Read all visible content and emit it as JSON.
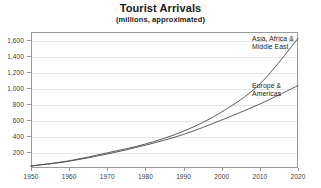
{
  "chart_data": {
    "type": "line",
    "title": "Tourist Arrivals",
    "subtitle": "(millions, approximated)",
    "xlabel": "",
    "ylabel": "",
    "xlim": [
      1950,
      2020
    ],
    "ylim": [
      0,
      1700
    ],
    "grid": true,
    "legend_position": "inline-right",
    "x": [
      1950,
      1960,
      1970,
      1980,
      1990,
      2000,
      2010,
      2020
    ],
    "x_tick_labels": [
      "1950",
      "1960",
      "1970",
      "1980",
      "1990",
      "2000",
      "2010",
      "2020"
    ],
    "y_ticks": [
      200,
      400,
      600,
      800,
      1000,
      1200,
      1400,
      1600
    ],
    "y_tick_labels": [
      "200",
      "400",
      "600",
      "800",
      "1,000",
      "1,200",
      "1,400",
      "1,600"
    ],
    "series": [
      {
        "name": "Asia, Africa & Middle East",
        "label_text": "Asia, Africa &\nMiddle East",
        "color": "#4a4a4a",
        "values": [
          25,
          90,
          190,
          300,
          460,
          700,
          1050,
          1620
        ]
      },
      {
        "name": "Europe & Americas",
        "label_text": "Europe &\nAmericas",
        "color": "#4a4a4a",
        "values": [
          25,
          85,
          175,
          285,
          420,
          600,
          800,
          1030
        ]
      }
    ]
  },
  "style": {
    "grid_color": "#e6e6e6",
    "frame_color": "#9a9a9a",
    "text_color": "#1a1a1a",
    "tick_text_color": "#3a3a3a",
    "background": "#ffffff"
  }
}
